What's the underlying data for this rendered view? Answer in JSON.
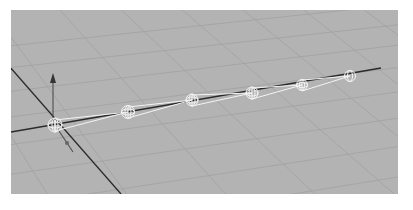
{
  "viewport": {
    "background": "#b3b3b3",
    "grid_color": "#9c9c9c",
    "axis_color": "#2a2a2a",
    "joint_color": "#f4f4f4"
  },
  "joint_chain": {
    "count": 6,
    "joints": [
      {
        "name": "joint1",
        "x": 44,
        "y": 115
      },
      {
        "name": "joint2",
        "x": 117,
        "y": 102
      },
      {
        "name": "joint3",
        "x": 181,
        "y": 90
      },
      {
        "name": "joint4",
        "x": 241,
        "y": 83
      },
      {
        "name": "joint5",
        "x": 291,
        "y": 75
      },
      {
        "name": "joint6",
        "x": 339,
        "y": 66
      }
    ]
  }
}
